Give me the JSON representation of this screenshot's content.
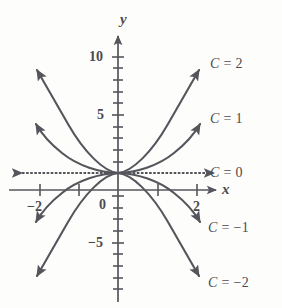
{
  "figure": {
    "background_color": "#fdfdfb",
    "ink_color": "#55555c",
    "text_color": "#4a4a50"
  },
  "chart_data": {
    "type": "line",
    "title": "",
    "subtitle": "",
    "xlabel": "x",
    "ylabel": "y",
    "xlim": [
      -2.8,
      2.8
    ],
    "ylim": [
      -7.5,
      11.5
    ],
    "grid": false,
    "legend": "inline-right-of-curves",
    "equation": "y = Cx^2",
    "x_ticks": [
      -2,
      -1,
      1,
      2
    ],
    "x_tick_labels": [
      "-2",
      "",
      "",
      "2"
    ],
    "y_ticks": [
      -7,
      -6,
      -5,
      -4,
      -3,
      -2,
      -1,
      0,
      1,
      2,
      3,
      4,
      5,
      6,
      7,
      8,
      9,
      10,
      11
    ],
    "y_tick_labels": [
      "",
      "",
      "-5",
      "",
      "",
      "",
      "",
      "0",
      "",
      "",
      "",
      "",
      "5",
      "",
      "",
      "",
      "",
      "10",
      ""
    ],
    "x": [
      -2.2,
      -1.8,
      -1.4,
      -1.0,
      -0.6,
      -0.2,
      0,
      0.2,
      0.6,
      1.0,
      1.4,
      1.8,
      2.2
    ],
    "series": [
      {
        "name": "C = 2",
        "C": 2,
        "label": "C = 2",
        "label_c": "C",
        "label_rest": " = 2",
        "values": [
          9.68,
          6.48,
          3.92,
          2.0,
          0.72,
          0.08,
          0,
          0.08,
          0.72,
          2.0,
          3.92,
          6.48,
          9.68
        ]
      },
      {
        "name": "C = 1",
        "C": 1,
        "label": "C = 1",
        "label_c": "C",
        "label_rest": " = 1",
        "values": [
          4.84,
          3.24,
          1.96,
          1.0,
          0.36,
          0.04,
          0,
          0.04,
          0.36,
          1.0,
          1.96,
          3.24,
          4.84
        ]
      },
      {
        "name": "C = 0",
        "C": 0,
        "label": "C = 0",
        "label_c": "C",
        "label_rest": " = 0",
        "values": [
          0,
          0,
          0,
          0,
          0,
          0,
          0,
          0,
          0,
          0,
          0,
          0,
          0
        ]
      },
      {
        "name": "C = -1",
        "C": -1,
        "label": "C = −1",
        "label_c": "C",
        "label_rest": " = −1",
        "values": [
          -4.84,
          -3.24,
          -1.96,
          -1.0,
          -0.36,
          -0.04,
          0,
          -0.04,
          -0.36,
          -1.0,
          -1.96,
          -3.24,
          -4.84
        ]
      },
      {
        "name": "C = -2",
        "C": -2,
        "label": "C = −2",
        "label_c": "C",
        "label_rest": " = −2",
        "values": [
          -9.68,
          -6.48,
          -3.92,
          -2.0,
          -0.72,
          -0.08,
          0,
          -0.08,
          -0.72,
          -2.0,
          -3.92,
          -6.48,
          -9.68
        ]
      }
    ]
  },
  "axes": {
    "x_axis_label": "x",
    "y_axis_label": "y",
    "x_tick_left": "−2",
    "x_tick_right": "2",
    "y_tick_10": "10",
    "y_tick_5": "5",
    "y_tick_0": "0",
    "y_tick_neg5": "−5"
  },
  "labels": {
    "c2": "C = 2",
    "c1": "C = 1",
    "c0": "C = 0",
    "cm1": "C = −1",
    "cm2": "C = −2"
  }
}
